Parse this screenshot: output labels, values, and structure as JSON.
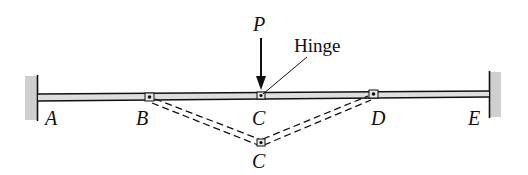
{
  "diagram": {
    "type": "beam-with-hinges",
    "colors": {
      "line": "#111111",
      "beam_fill": "#d9d9d9",
      "wall_fill": "#c8c8c8",
      "background": "#ffffff"
    },
    "load": {
      "label": "P",
      "direction": "down",
      "at": "C"
    },
    "annotation": {
      "label": "Hinge",
      "points_to": "C"
    },
    "points": [
      {
        "id": "A",
        "label": "A",
        "type": "fixed-support"
      },
      {
        "id": "B",
        "label": "B",
        "type": "hinge"
      },
      {
        "id": "C",
        "label": "C",
        "type": "hinge"
      },
      {
        "id": "D",
        "label": "D",
        "type": "hinge"
      },
      {
        "id": "E",
        "label": "E",
        "type": "fixed-support"
      }
    ],
    "deflected_shape": {
      "style": "dashed",
      "path": [
        "B",
        "C'",
        "D"
      ],
      "deflected_label": "C"
    }
  }
}
